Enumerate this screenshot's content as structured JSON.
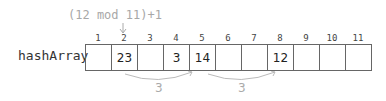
{
  "formula": "(12 mod 11)+1",
  "array_name": "hashArray",
  "indices": [
    "1",
    "2",
    "3",
    "4",
    "5",
    "6",
    "7",
    "8",
    "9",
    "10",
    "11"
  ],
  "cells": [
    "",
    "23",
    "",
    "3",
    "14",
    "",
    "",
    "12",
    "",
    "",
    ""
  ],
  "jumps": [
    {
      "from_index": "2",
      "to_index": "5",
      "label": "3"
    },
    {
      "from_index": "5",
      "to_index": "8",
      "label": "3"
    }
  ],
  "colors": {
    "annotation": "#aaaaaa",
    "border": "#666666",
    "text": "#222222"
  }
}
